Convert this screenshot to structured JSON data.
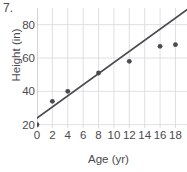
{
  "figure": {
    "problem_number": "7.",
    "background_color": "#ffffff"
  },
  "chart_data": {
    "type": "scatter",
    "title": "",
    "xlabel": "Age (yr)",
    "ylabel": "Height (in)",
    "xlim": [
      0,
      19.5
    ],
    "ylim": [
      18,
      90
    ],
    "grid": true,
    "legend": null,
    "xticks": [
      0,
      2,
      4,
      6,
      8,
      10,
      12,
      14,
      16,
      18
    ],
    "xticklabels": [
      "0",
      "2",
      "4",
      "6",
      "8",
      "10",
      "12",
      "14",
      "16",
      "18"
    ],
    "yticks": [
      20,
      40,
      60,
      80
    ],
    "yticklabels": [
      "20",
      "40",
      "60",
      "80"
    ],
    "point_color": "#4a4a4f",
    "line_color": "#4a4a4f",
    "grid_color": "#d8d8dc",
    "points": [
      {
        "x": 0,
        "y": 20
      },
      {
        "x": 2,
        "y": 34
      },
      {
        "x": 4,
        "y": 40
      },
      {
        "x": 8,
        "y": 51
      },
      {
        "x": 12,
        "y": 58
      },
      {
        "x": 16,
        "y": 67
      },
      {
        "x": 18,
        "y": 68
      }
    ],
    "trend_line": {
      "name": "line of best fit",
      "x_start": 0,
      "y_start": 24,
      "x_end": 19.5,
      "y_end": 89
    }
  }
}
